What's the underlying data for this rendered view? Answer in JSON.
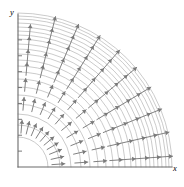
{
  "figure": {
    "background_color": "#ffffff"
  },
  "axes": {
    "x_label": "x",
    "y_label": "y",
    "origin_px": [
      18,
      167
    ],
    "x_axis_end_px": [
      172,
      167
    ],
    "y_axis_end_px": [
      18,
      14
    ],
    "axis_color": "#6b6b6b",
    "x_tick_count": 0,
    "y_tick_count": 8,
    "y_tick_length_px": 4
  },
  "chart_data": {
    "type": "scatter",
    "xlabel": "x",
    "ylabel": "y",
    "grid": false,
    "legend": "none",
    "xlim": [
      0,
      1
    ],
    "ylim": [
      0,
      1
    ],
    "arc_color": "#b9b9b9",
    "vector_color": "#7a7a7a",
    "arc_radii_px": [
      30,
      42,
      53,
      63,
      72,
      80,
      88,
      95,
      101,
      107,
      113,
      118,
      123,
      128,
      132,
      136,
      140,
      144,
      148,
      151,
      154
    ],
    "vector_rays_deg": [
      4,
      13,
      22,
      31,
      40,
      49,
      58,
      67,
      76,
      85
    ],
    "vector_sample_radii_px": [
      34,
      57,
      76,
      92,
      105,
      118,
      130,
      142,
      152
    ],
    "vector_length_px": 13,
    "arrow_head_length_px": 3.6,
    "arrow_head_width_px": 2.4,
    "series": [
      {
        "name": "radial-vectors",
        "direction": "outward",
        "count": 55
      },
      {
        "name": "equipotential-arcs",
        "shape": "quarter-circle",
        "count": 21
      }
    ]
  }
}
